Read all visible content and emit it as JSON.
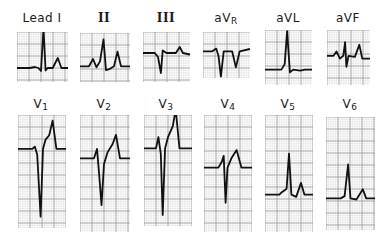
{
  "figure": {
    "grid_color_minor": "#d4d4d4",
    "grid_color_major": "#9a9a9a",
    "trace_color": "#111111"
  },
  "leads": [
    {
      "id": "I",
      "label": "Lead I",
      "sub": "",
      "x": 17,
      "y": 32,
      "w": 51,
      "h": 50,
      "label_x": 42,
      "label_y": 11,
      "baseline": 0.72,
      "trace": [
        [
          0,
          0
        ],
        [
          0.25,
          0
        ],
        [
          0.35,
          -0.02
        ],
        [
          0.42,
          0
        ],
        [
          0.47,
          0.06
        ],
        [
          0.52,
          -0.8
        ],
        [
          0.56,
          0.05
        ],
        [
          0.6,
          0
        ],
        [
          0.7,
          0
        ],
        [
          0.8,
          -0.2
        ],
        [
          0.87,
          0
        ],
        [
          1,
          0
        ]
      ]
    },
    {
      "id": "II",
      "label": "II",
      "sub": "",
      "x": 80,
      "y": 33,
      "w": 50,
      "h": 49,
      "label_x": 104,
      "label_y": 11,
      "baseline": 0.68,
      "trace": [
        [
          0,
          0
        ],
        [
          0.18,
          0
        ],
        [
          0.26,
          -0.15
        ],
        [
          0.33,
          0.02
        ],
        [
          0.4,
          -0.1
        ],
        [
          0.47,
          -0.55
        ],
        [
          0.52,
          0.08
        ],
        [
          0.6,
          0.05
        ],
        [
          0.68,
          0
        ],
        [
          0.75,
          -0.3
        ],
        [
          0.82,
          0
        ],
        [
          1,
          0
        ]
      ]
    },
    {
      "id": "III",
      "label": "III",
      "sub": "",
      "x": 143,
      "y": 32,
      "w": 47,
      "h": 50,
      "label_x": 166,
      "label_y": 11,
      "baseline": 0.42,
      "trace": [
        [
          0,
          0
        ],
        [
          0.25,
          0
        ],
        [
          0.32,
          0.08
        ],
        [
          0.38,
          0.4
        ],
        [
          0.42,
          -0.05
        ],
        [
          0.5,
          0
        ],
        [
          0.7,
          0
        ],
        [
          0.78,
          -0.12
        ],
        [
          0.85,
          0
        ],
        [
          1,
          0.03
        ]
      ]
    },
    {
      "id": "aVR",
      "label": "aV",
      "sub": "R",
      "x": 203,
      "y": 32,
      "w": 47,
      "h": 46,
      "label_x": 226,
      "label_y": 11,
      "baseline": 0.42,
      "trace": [
        [
          0,
          0
        ],
        [
          0.2,
          0
        ],
        [
          0.28,
          -0.06
        ],
        [
          0.33,
          0.1
        ],
        [
          0.38,
          0.55
        ],
        [
          0.44,
          0
        ],
        [
          0.55,
          0
        ],
        [
          0.62,
          0
        ],
        [
          0.7,
          0.35
        ],
        [
          0.78,
          0
        ],
        [
          1,
          -0.05
        ]
      ]
    },
    {
      "id": "aVL",
      "label": "aVL",
      "sub": "",
      "x": 265,
      "y": 30,
      "w": 47,
      "h": 55,
      "label_x": 288,
      "label_y": 11,
      "baseline": 0.72,
      "trace": [
        [
          0,
          0
        ],
        [
          0.35,
          0
        ],
        [
          0.42,
          -0.1
        ],
        [
          0.47,
          -0.7
        ],
        [
          0.53,
          0.05
        ],
        [
          0.6,
          0
        ],
        [
          0.75,
          0.02
        ],
        [
          0.85,
          0
        ],
        [
          1,
          0
        ]
      ]
    },
    {
      "id": "aVF",
      "label": "aVF",
      "sub": "",
      "x": 327,
      "y": 30,
      "w": 43,
      "h": 55,
      "label_x": 348,
      "label_y": 11,
      "baseline": 0.47,
      "trace": [
        [
          0,
          0
        ],
        [
          0.15,
          0
        ],
        [
          0.22,
          -0.08
        ],
        [
          0.3,
          0.05
        ],
        [
          0.38,
          0
        ],
        [
          0.42,
          -0.25
        ],
        [
          0.45,
          0.2
        ],
        [
          0.5,
          0
        ],
        [
          0.65,
          0.02
        ],
        [
          0.75,
          -0.2
        ],
        [
          0.82,
          0.05
        ],
        [
          1,
          0.05
        ]
      ]
    },
    {
      "id": "V1",
      "label": "V",
      "sub": "1",
      "x": 18,
      "y": 115,
      "w": 48,
      "h": 113,
      "label_x": 41,
      "label_y": 97,
      "baseline": 0.3,
      "trace": [
        [
          0,
          0
        ],
        [
          0.3,
          0
        ],
        [
          0.35,
          -0.02
        ],
        [
          0.4,
          0.05
        ],
        [
          0.47,
          0.6
        ],
        [
          0.52,
          0
        ],
        [
          0.57,
          -0.08
        ],
        [
          0.65,
          -0.12
        ],
        [
          0.72,
          -0.25
        ],
        [
          0.8,
          0
        ],
        [
          1,
          0
        ]
      ]
    },
    {
      "id": "V2",
      "label": "V",
      "sub": "2",
      "x": 80,
      "y": 115,
      "w": 50,
      "h": 117,
      "label_x": 104,
      "label_y": 97,
      "baseline": 0.37,
      "trace": [
        [
          0,
          0
        ],
        [
          0.28,
          0
        ],
        [
          0.34,
          -0.08
        ],
        [
          0.38,
          0.12
        ],
        [
          0.43,
          0.4
        ],
        [
          0.48,
          0.05
        ],
        [
          0.55,
          -0.05
        ],
        [
          0.65,
          -0.12
        ],
        [
          0.72,
          -0.2
        ],
        [
          0.8,
          0
        ],
        [
          1,
          0
        ]
      ]
    },
    {
      "id": "V3",
      "label": "V",
      "sub": "3",
      "x": 144,
      "y": 115,
      "w": 48,
      "h": 111,
      "label_x": 166,
      "label_y": 97,
      "baseline": 0.3,
      "trace": [
        [
          0,
          0
        ],
        [
          0.25,
          0
        ],
        [
          0.3,
          -0.1
        ],
        [
          0.35,
          0.05
        ],
        [
          0.39,
          0.6
        ],
        [
          0.44,
          0.0
        ],
        [
          0.5,
          -0.1
        ],
        [
          0.6,
          -0.2
        ],
        [
          0.66,
          -0.35
        ],
        [
          0.74,
          0
        ],
        [
          1,
          0
        ]
      ]
    },
    {
      "id": "V4",
      "label": "V",
      "sub": "4",
      "x": 204,
      "y": 115,
      "w": 48,
      "h": 117,
      "label_x": 228,
      "label_y": 97,
      "baseline": 0.45,
      "trace": [
        [
          0,
          0
        ],
        [
          0.3,
          0
        ],
        [
          0.37,
          -0.05
        ],
        [
          0.41,
          -0.1
        ],
        [
          0.45,
          0.3
        ],
        [
          0.49,
          0
        ],
        [
          0.57,
          -0.08
        ],
        [
          0.68,
          -0.15
        ],
        [
          0.78,
          0
        ],
        [
          1,
          0
        ]
      ]
    },
    {
      "id": "V5",
      "label": "V",
      "sub": "5",
      "x": 265,
      "y": 115,
      "w": 48,
      "h": 117,
      "label_x": 288,
      "label_y": 97,
      "baseline": 0.68,
      "trace": [
        [
          0,
          0
        ],
        [
          0.3,
          0
        ],
        [
          0.35,
          -0.02
        ],
        [
          0.45,
          -0.05
        ],
        [
          0.5,
          -0.35
        ],
        [
          0.55,
          0
        ],
        [
          0.65,
          0.02
        ],
        [
          0.75,
          -0.1
        ],
        [
          0.82,
          0
        ],
        [
          1,
          0
        ]
      ]
    },
    {
      "id": "V6",
      "label": "V",
      "sub": "6",
      "x": 326,
      "y": 117,
      "w": 49,
      "h": 113,
      "label_x": 350,
      "label_y": 97,
      "baseline": 0.72,
      "trace": [
        [
          0,
          0
        ],
        [
          0.3,
          0
        ],
        [
          0.38,
          -0.02
        ],
        [
          0.45,
          -0.3
        ],
        [
          0.5,
          0
        ],
        [
          0.62,
          0.01
        ],
        [
          0.75,
          -0.08
        ],
        [
          0.82,
          0
        ],
        [
          1,
          0
        ]
      ]
    }
  ]
}
